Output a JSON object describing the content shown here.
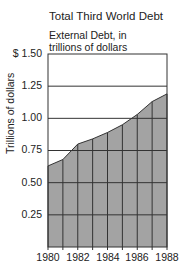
{
  "chart_data": {
    "type": "area",
    "title": "Total Third World Debt",
    "subtitle": "External Debt, in trillions of dollars",
    "xlabel": "",
    "ylabel": "Trillions of dollars",
    "x": [
      1980,
      1981,
      1982,
      1983,
      1984,
      1985,
      1986,
      1987,
      1988
    ],
    "values": [
      0.63,
      0.68,
      0.8,
      0.84,
      0.89,
      0.95,
      1.03,
      1.13,
      1.19
    ],
    "ylim": [
      0,
      1.5
    ],
    "xlim": [
      1980,
      1988
    ],
    "y_ticks": [
      "0.25",
      "0.50",
      "0.75",
      "1.00",
      "1.25",
      "$ 1.50"
    ],
    "x_ticks": [
      "1980",
      "1982",
      "1984",
      "1986",
      "1988"
    ],
    "grid": true,
    "legend": null,
    "colors": {
      "fill": "#a3a3a3",
      "line": "#333333"
    }
  },
  "labels": {
    "title": "Total Third World Debt",
    "subtitle_line1": "External Debt, in",
    "subtitle_line2": "trillions of dollars",
    "ylabel": "Trillions of dollars",
    "yt_150": "$ 1.50",
    "yt_125": "1.25",
    "yt_100": "1.00",
    "yt_075": "0.75",
    "yt_050": "0.50",
    "yt_025": "0.25",
    "xt_1980": "1980",
    "xt_1982": "1982",
    "xt_1984": "1984",
    "xt_1986": "1986",
    "xt_1988": "1988"
  }
}
